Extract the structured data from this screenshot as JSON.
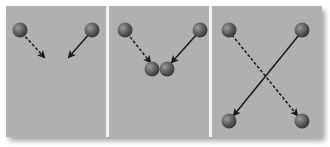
{
  "diagram": {
    "colors": {
      "background": "#b0b0b0",
      "divider": "#f4f4f4",
      "sphere": "#6e6e6e",
      "arrow": "#1a1a1a"
    },
    "panels": [
      {
        "id": "before",
        "spheres": [
          [
            20,
            30
          ],
          [
            92,
            30
          ]
        ],
        "arrows": [
          {
            "from": [
              22,
              33
            ],
            "to": [
              44,
              57
            ],
            "style": "dashed"
          },
          {
            "from": [
              90,
              33
            ],
            "to": [
              69,
              57
            ],
            "style": "solid"
          }
        ]
      },
      {
        "id": "collision",
        "spheres": [
          [
            125,
            30
          ],
          [
            200,
            30
          ],
          [
            152,
            69
          ],
          [
            167,
            69
          ]
        ],
        "arrows": [
          {
            "from": [
              127,
              33
            ],
            "to": [
              150,
              62
            ],
            "style": "dashed"
          },
          {
            "from": [
              198,
              33
            ],
            "to": [
              172,
              62
            ],
            "style": "solid"
          }
        ]
      },
      {
        "id": "after",
        "spheres": [
          [
            229,
            30
          ],
          [
            302,
            30
          ],
          [
            229,
            121
          ],
          [
            302,
            121
          ]
        ],
        "arrows": [
          {
            "from": [
              232,
              35
            ],
            "to": [
              297,
              115
            ],
            "style": "dashed"
          },
          {
            "from": [
              299,
              35
            ],
            "to": [
              234,
              115
            ],
            "style": "solid"
          }
        ]
      }
    ]
  }
}
